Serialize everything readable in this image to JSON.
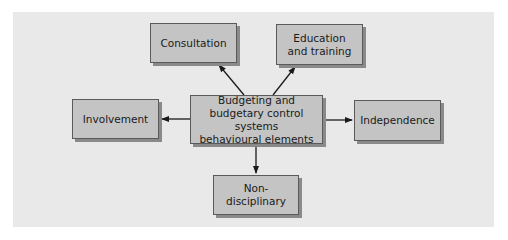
{
  "diagram": {
    "type": "hub-and-spoke",
    "colors": {
      "background": "#e9e9e9",
      "box_fill": "#c4c4c4",
      "box_border": "#5a5a5a",
      "box_shadow": "#8a8a8a",
      "arrow": "#1a1a1a"
    },
    "center": {
      "label": "Budgeting and budgetary control systems behavioural elements",
      "lines": [
        "Budgeting and",
        "budgetary control systems",
        "behavioural elements"
      ]
    },
    "nodes": [
      {
        "id": "consultation",
        "label": "Consultation",
        "position": "top-left"
      },
      {
        "id": "education",
        "label": "Education and training",
        "lines": [
          "Education",
          "and training"
        ],
        "position": "top-right"
      },
      {
        "id": "involvement",
        "label": "Involvement",
        "position": "left"
      },
      {
        "id": "independence",
        "label": "Independence",
        "position": "right"
      },
      {
        "id": "non-disciplinary",
        "label": "Non-disciplinary",
        "position": "bottom"
      }
    ],
    "edges": [
      {
        "from": "center",
        "to": "consultation"
      },
      {
        "from": "center",
        "to": "education"
      },
      {
        "from": "center",
        "to": "involvement"
      },
      {
        "from": "center",
        "to": "independence"
      },
      {
        "from": "center",
        "to": "non-disciplinary"
      }
    ]
  }
}
